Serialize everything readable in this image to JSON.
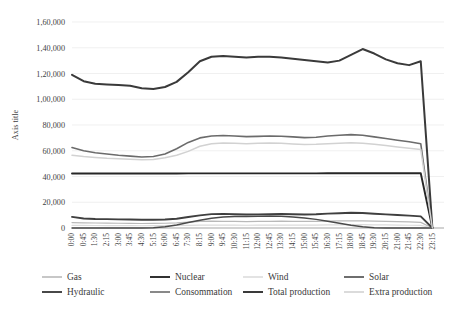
{
  "chart_data": {
    "type": "line",
    "title": "",
    "xlabel": "",
    "ylabel": "Axis title",
    "ylim": [
      0,
      160000
    ],
    "ytick_step": 20000,
    "grid": true,
    "legend_position": "bottom",
    "number_format": "indian",
    "ytick_labels": [
      "0",
      "20,000",
      "40,000",
      "60,000",
      "80,000",
      "1,00,000",
      "1,20,000",
      "1,40,000",
      "1,60,000"
    ],
    "ytick_values": [
      0,
      20000,
      40000,
      60000,
      80000,
      100000,
      120000,
      140000,
      160000
    ],
    "categories": [
      "0:00",
      "0:45",
      "1:30",
      "2:15",
      "3:00",
      "3:45",
      "4:30",
      "5:15",
      "6:00",
      "6:45",
      "7:30",
      "8:15",
      "9:00",
      "9:45",
      "10:30",
      "11:15",
      "12:00",
      "12:45",
      "13:30",
      "14:15",
      "15:00",
      "15:45",
      "16:30",
      "17:15",
      "18:00",
      "18:45",
      "19:30",
      "20:15",
      "21:00",
      "21:45",
      "22:30",
      "23:15"
    ],
    "series": [
      {
        "name": "Gas",
        "color": "#b9b9b9",
        "width": 1.2,
        "values": [
          4200,
          4000,
          3900,
          3800,
          3700,
          3600,
          3500,
          3600,
          3700,
          4000,
          4600,
          5100,
          5300,
          5200,
          5100,
          5000,
          5100,
          5200,
          5300,
          5200,
          5100,
          5200,
          5400,
          5500,
          5600,
          5500,
          5300,
          5100,
          4900,
          4700,
          4400,
          0
        ]
      },
      {
        "name": "Nuclear",
        "color": "#262626",
        "width": 1.9,
        "values": [
          42300,
          42300,
          42300,
          42300,
          42300,
          42300,
          42300,
          42300,
          42300,
          42300,
          42400,
          42400,
          42400,
          42400,
          42400,
          42400,
          42400,
          42400,
          42400,
          42400,
          42400,
          42400,
          42500,
          42500,
          42500,
          42500,
          42500,
          42500,
          42500,
          42500,
          42500,
          0
        ]
      },
      {
        "name": "Wind",
        "color": "#dcdcdc",
        "width": 1.2,
        "values": [
          2100,
          2000,
          1950,
          1900,
          1850,
          1800,
          1750,
          1800,
          1900,
          2000,
          2100,
          2200,
          2300,
          2250,
          2200,
          2150,
          2200,
          2250,
          2300,
          2250,
          2200,
          2250,
          2400,
          2500,
          2600,
          2550,
          2450,
          2350,
          2250,
          2150,
          2050,
          0
        ]
      },
      {
        "name": "Solar",
        "color": "#4a4a4a",
        "width": 1.5,
        "values": [
          0,
          0,
          0,
          0,
          0,
          0,
          0,
          100,
          900,
          2400,
          4200,
          6000,
          7600,
          8600,
          9000,
          8900,
          9200,
          9400,
          9100,
          8600,
          7800,
          6700,
          5300,
          3700,
          2100,
          900,
          200,
          0,
          0,
          0,
          0,
          0
        ]
      },
      {
        "name": "Hydraulic",
        "color": "#3f3f3f",
        "width": 1.9,
        "values": [
          8600,
          7400,
          7000,
          6900,
          6700,
          6600,
          6400,
          6400,
          6600,
          7200,
          8500,
          9800,
          10800,
          11000,
          10700,
          10500,
          10600,
          10800,
          10900,
          10700,
          10500,
          10700,
          11200,
          11500,
          11800,
          11600,
          11100,
          10600,
          10100,
          9600,
          9000,
          0
        ]
      },
      {
        "name": "Consommation",
        "color": "#6b6b6b",
        "width": 1.6,
        "values": [
          62500,
          60000,
          58500,
          57500,
          56500,
          55800,
          55200,
          55500,
          57500,
          61500,
          66500,
          70000,
          71500,
          71800,
          71500,
          71000,
          71200,
          71500,
          71300,
          70800,
          70200,
          70500,
          71500,
          72000,
          72500,
          72000,
          70800,
          69500,
          68200,
          67000,
          65500,
          0
        ]
      },
      {
        "name": "Total production",
        "color": "#3a3a3a",
        "width": 2.0,
        "values": [
          119000,
          114000,
          112000,
          111500,
          111000,
          110500,
          108500,
          108000,
          109500,
          113500,
          121000,
          129500,
          133000,
          133500,
          133000,
          132500,
          133000,
          133000,
          132500,
          131500,
          130500,
          129500,
          128500,
          130000,
          134500,
          139000,
          135500,
          131000,
          128000,
          126500,
          129500,
          0
        ]
      },
      {
        "name": "Extra production",
        "color": "#d2d2d2",
        "width": 1.5,
        "values": [
          56500,
          55500,
          54800,
          54200,
          53800,
          53400,
          53000,
          53200,
          54500,
          56500,
          59500,
          63500,
          65500,
          66000,
          65800,
          65500,
          65800,
          66000,
          65800,
          65300,
          64800,
          65000,
          65500,
          65800,
          66200,
          65800,
          65000,
          64000,
          63000,
          62000,
          61000,
          0
        ]
      }
    ]
  },
  "legend": {
    "row1": [
      {
        "label": "Gas"
      },
      {
        "label": "Nuclear"
      },
      {
        "label": "Wind"
      },
      {
        "label": "Solar"
      }
    ],
    "row2": [
      {
        "label": "Hydraulic"
      },
      {
        "label": "Consommation"
      },
      {
        "label": "Total production"
      },
      {
        "label": "Extra production"
      }
    ]
  }
}
